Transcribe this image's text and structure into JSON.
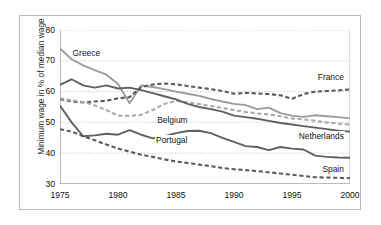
{
  "chart_data": {
    "type": "line",
    "title": "",
    "subtitle": "",
    "xlabel": "",
    "ylabel": "Minimum wage in % of median wage",
    "xlim": [
      1975,
      2000
    ],
    "ylim": [
      30,
      80
    ],
    "yticks": [
      30,
      40,
      50,
      60,
      70,
      80
    ],
    "xticks": [
      1975,
      1980,
      1985,
      1990,
      1995,
      2000
    ],
    "grid": "horizontal-dotted",
    "legend": "inline-annotations",
    "x": [
      1975,
      1976,
      1977,
      1978,
      1979,
      1980,
      1981,
      1982,
      1983,
      1984,
      1985,
      1986,
      1987,
      1988,
      1989,
      1990,
      1991,
      1992,
      1993,
      1994,
      1995,
      1996,
      1997,
      1998,
      1999,
      2000
    ],
    "series": [
      {
        "name": "Greece",
        "style": "solid",
        "color": "#9c9c9c",
        "label": "Greece",
        "values": [
          74.0,
          70.5,
          68.5,
          67.0,
          65.5,
          62.5,
          56.2,
          62.0,
          61.5,
          60.8,
          60.0,
          59.3,
          58.6,
          57.6,
          56.8,
          56.0,
          55.6,
          54.3,
          54.8,
          53.0,
          52.2,
          51.8,
          52.3,
          52.0,
          51.7,
          51.3
        ]
      },
      {
        "name": "France",
        "style": "dashed",
        "color": "#5c5c5c",
        "label": "France",
        "values": [
          57.5,
          56.8,
          56.5,
          56.8,
          57.0,
          57.8,
          58.2,
          61.5,
          62.3,
          62.6,
          62.4,
          61.8,
          61.3,
          60.8,
          60.2,
          59.3,
          59.6,
          59.4,
          59.2,
          58.8,
          57.7,
          59.2,
          60.0,
          60.2,
          60.4,
          60.7
        ]
      },
      {
        "name": "Belgium",
        "style": "dashed",
        "color": "#a9a9a9",
        "label": "Belgium",
        "values": [
          57.8,
          57.2,
          56.6,
          55.5,
          54.0,
          52.2,
          52.1,
          52.5,
          54.0,
          56.0,
          57.0,
          56.5,
          56.0,
          55.3,
          54.7,
          54.0,
          53.4,
          52.9,
          52.6,
          52.0,
          51.3,
          51.0,
          50.5,
          50.0,
          49.6,
          49.3
        ]
      },
      {
        "name": "Netherlands",
        "style": "solid",
        "color": "#606060",
        "label": "Netherlands",
        "values": [
          62.2,
          64.0,
          62.0,
          61.3,
          62.0,
          61.0,
          61.3,
          60.5,
          59.5,
          58.5,
          57.5,
          56.0,
          55.0,
          54.3,
          53.5,
          52.2,
          51.7,
          51.2,
          50.5,
          49.8,
          49.3,
          48.8,
          48.3,
          47.8,
          47.3,
          47.0
        ]
      },
      {
        "name": "Portugal",
        "style": "solid",
        "color": "#606060",
        "label": "Portugal",
        "values": [
          55.5,
          50.0,
          45.5,
          45.8,
          46.3,
          46.0,
          47.5,
          46.0,
          44.8,
          45.5,
          46.5,
          47.2,
          47.3,
          46.5,
          45.0,
          43.7,
          42.3,
          42.0,
          41.0,
          42.0,
          41.5,
          41.2,
          39.2,
          38.8,
          38.6,
          38.5
        ]
      },
      {
        "name": "Spain",
        "style": "dashed",
        "color": "#5c5c5c",
        "label": "Spain",
        "values": [
          47.8,
          47.0,
          45.5,
          44.2,
          42.8,
          41.5,
          40.5,
          39.5,
          38.8,
          38.0,
          37.3,
          36.8,
          36.3,
          35.8,
          35.2,
          34.8,
          34.5,
          34.2,
          33.8,
          33.4,
          33.0,
          32.6,
          32.2,
          32.1,
          32.0,
          31.9
        ]
      }
    ]
  },
  "axis": {
    "ytick_labels": [
      "30",
      "40",
      "50",
      "60",
      "70",
      "80"
    ],
    "xtick_labels": [
      "1975",
      "1980",
      "1985",
      "1990",
      "1995",
      "2000"
    ],
    "ylabel": "Minimum wage in % of median wage"
  },
  "annotations": {
    "greece": "Greece",
    "france": "France",
    "belgium": "Belgium",
    "netherlands": "Netherlands",
    "portugal": "Portugal",
    "spain": "Spain"
  }
}
